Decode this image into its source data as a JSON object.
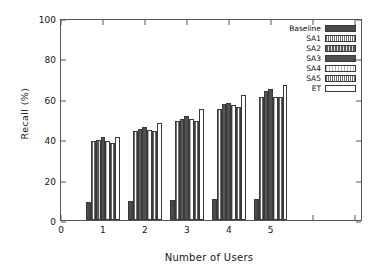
{
  "chart_data": {
    "type": "bar",
    "title": "",
    "xlabel": "Number of Users",
    "ylabel": "Recall  (%)",
    "categories": [
      "1",
      "2",
      "3",
      "4",
      "5"
    ],
    "xtick_labels": [
      "0",
      "1",
      "2",
      "3",
      "4",
      "5"
    ],
    "ytick_labels": [
      "0",
      "20",
      "40",
      "60",
      "80",
      "100"
    ],
    "xlim": [
      0,
      7.2
    ],
    "ylim": [
      0,
      100
    ],
    "grid": false,
    "legend_position": "top-right",
    "series": [
      {
        "name": "Baseline",
        "color": "#4a4a4a",
        "pattern": "solid-dark",
        "values": [
          9.0,
          9.2,
          10.0,
          10.6,
          10.6
        ]
      },
      {
        "name": "SA1",
        "color": "#6e6e6e",
        "pattern": "vertical-mid",
        "values": [
          39.0,
          44.0,
          49.0,
          55.0,
          61.0
        ]
      },
      {
        "name": "SA2",
        "color": "#5a5a5a",
        "pattern": "vertical-dark",
        "values": [
          39.5,
          45.0,
          50.0,
          57.5,
          64.0
        ]
      },
      {
        "name": "SA3",
        "color": "#4f4f4f",
        "pattern": "solid-dark",
        "values": [
          41.0,
          46.0,
          51.5,
          58.0,
          65.0
        ]
      },
      {
        "name": "SA4",
        "color": "#b4b4b4",
        "pattern": "light",
        "values": [
          39.0,
          44.5,
          50.0,
          57.0,
          61.0
        ]
      },
      {
        "name": "SA5",
        "color": "#6a6a6a",
        "pattern": "vertical-mid",
        "values": [
          38.0,
          44.0,
          49.0,
          56.0,
          61.0
        ]
      },
      {
        "name": "ET",
        "color": "#ffffff",
        "pattern": "open",
        "values": [
          41.0,
          48.0,
          55.0,
          62.0,
          67.0
        ]
      }
    ]
  }
}
